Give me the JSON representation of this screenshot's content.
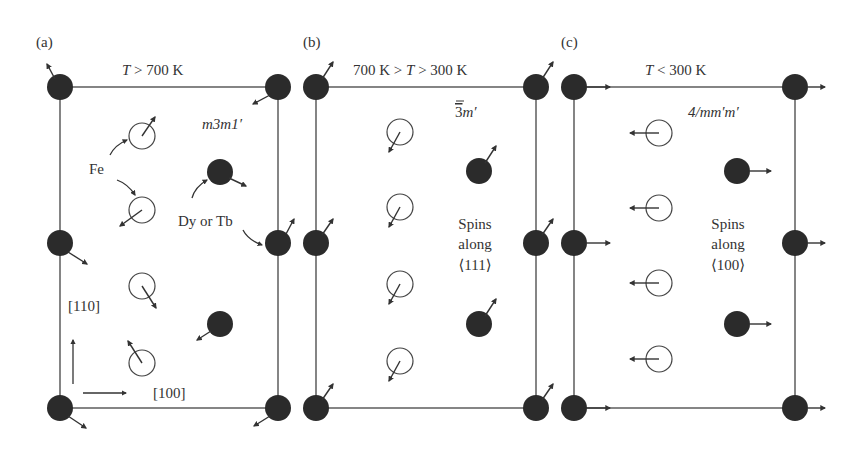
{
  "figure": {
    "colors": {
      "line": "#444444",
      "rare_earth_atom": "#2b2b2b",
      "fe_atom_stroke": "#444444",
      "background": "#ffffff"
    },
    "panels": [
      {
        "id": "a",
        "label": "(a)",
        "temperature": "T > 700 K",
        "temperature_parts": {
          "var": "T",
          "rest": " > 700 K"
        },
        "symmetry": "m3m1′",
        "annotations": {
          "fe_label": "Fe",
          "re_label": "Dy or Tb",
          "axis_vertical": "[110]",
          "axis_horizontal": "[100]"
        }
      },
      {
        "id": "b",
        "label": "(b)",
        "temperature": "700 K > T > 300 K",
        "temperature_parts": {
          "pre": "700 K > ",
          "var": "T",
          "rest": " > 300 K"
        },
        "symmetry": "3̄m′",
        "symmetry_parts": {
          "num": "3",
          "rest": "m′"
        },
        "spin_note": [
          "Spins",
          "along",
          "⟨111⟩"
        ]
      },
      {
        "id": "c",
        "label": "(c)",
        "temperature": "T < 300 K",
        "temperature_parts": {
          "var": "T",
          "rest": " < 300 K"
        },
        "symmetry": "4/mm′m′",
        "spin_note": [
          "Spins",
          "along",
          "⟨100⟩"
        ]
      }
    ]
  }
}
